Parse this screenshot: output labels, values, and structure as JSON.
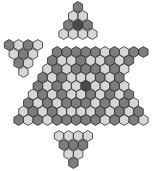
{
  "colors": {
    "D": "#4a4a4a",
    "M": "#7d7d7d",
    "L": "#d6d6d6",
    "stroke": "#2e2e2e",
    "background": "#ffffff"
  },
  "geometry": {
    "dx": 9.6,
    "dy": 8.4,
    "radius": 5.4
  },
  "pieces": [
    {
      "name": "top-triangle-piece",
      "rows": [
        {
          "x": 78,
          "y": 7,
          "cells": "M"
        },
        {
          "x": 73.2,
          "y": 16,
          "cells": "LL"
        },
        {
          "x": 68.4,
          "y": 25,
          "cells": "MDM"
        },
        {
          "x": 63.6,
          "y": 34,
          "cells": "LLLL"
        }
      ]
    },
    {
      "name": "left-triangle-piece",
      "rows": [
        {
          "x": 9,
          "y": 45,
          "cells": "MLML"
        },
        {
          "x": 13.8,
          "y": 54,
          "cells": "LML"
        },
        {
          "x": 18.6,
          "y": 63,
          "cells": "ML"
        },
        {
          "x": 23.4,
          "y": 72,
          "cells": "L"
        }
      ]
    },
    {
      "name": "main-board-piece",
      "rows": [
        {
          "x": 57,
          "y": 52,
          "cells": "MMMMMLMLMM"
        },
        {
          "x": 52.2,
          "y": 60.5,
          "cells": "MLLMLLMLM"
        },
        {
          "x": 47.4,
          "y": 69,
          "cells": "LMLMMMLML"
        },
        {
          "x": 42.6,
          "y": 77.5,
          "cells": "MLMLLLMLM"
        },
        {
          "x": 37.8,
          "y": 86,
          "cells": "MLMLLDLLML"
        },
        {
          "x": 33,
          "y": 94.5,
          "cells": "LMLMLLMLMLM"
        },
        {
          "x": 28.2,
          "y": 103,
          "cells": "MLMLMMMLMLML"
        },
        {
          "x": 23.4,
          "y": 111.5,
          "cells": "LMLMLLLLMLMLM"
        },
        {
          "x": 18.6,
          "y": 120,
          "cells": "MLMLMMMMMLMLML"
        },
        {
          "x": 59,
          "y": 136,
          "cells": "LLLL"
        },
        {
          "x": 63.8,
          "y": 145,
          "cells": "MMM"
        },
        {
          "x": 68.6,
          "y": 154,
          "cells": "LL"
        },
        {
          "x": 73.4,
          "y": 163,
          "cells": "M"
        }
      ]
    }
  ]
}
